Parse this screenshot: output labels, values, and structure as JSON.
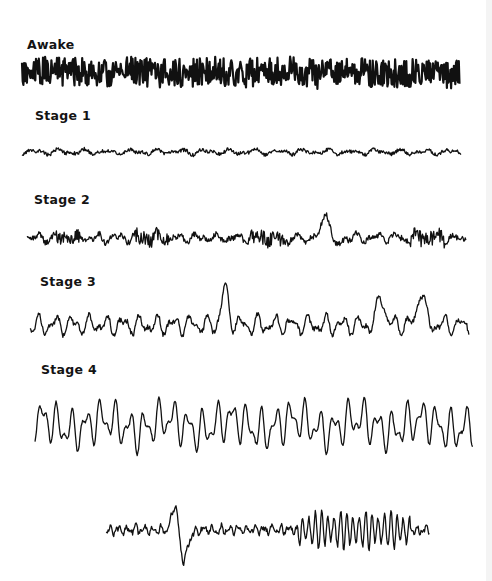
{
  "figure": {
    "ink_color": "#111111",
    "background": "#ffffff",
    "panels": [
      {
        "id": "awake",
        "label": "Awake",
        "label_pos": [
          27,
          37
        ],
        "trace": {
          "x0": 22,
          "x1": 460,
          "y": 72,
          "amp_slow": 3,
          "amp_fast": 9,
          "slow_cycles": 6,
          "fast_density": 1.0,
          "spikes": [],
          "stroke": 2.2,
          "seed": 11
        }
      },
      {
        "id": "stage-1",
        "label": "Stage 1",
        "label_pos": [
          35,
          108
        ],
        "trace": {
          "x0": 22,
          "x1": 461,
          "y": 152,
          "amp_slow": 3,
          "amp_fast": 2,
          "slow_cycles": 18,
          "fast_density": 0.55,
          "spikes": [],
          "stroke": 1.3,
          "seed": 23
        }
      },
      {
        "id": "stage-2",
        "label": "Stage 2",
        "label_pos": [
          34,
          192
        ],
        "trace": {
          "x0": 27,
          "x1": 466,
          "y": 238,
          "amp_slow": 5,
          "amp_fast": 3,
          "slow_cycles": 22,
          "fast_density": 0.6,
          "spindles": [
            [
              55,
              80
            ],
            [
              135,
              170
            ],
            [
              250,
              290
            ],
            [
              410,
              445
            ]
          ],
          "spikes": [
            {
              "x": 327,
              "h": -30,
              "w": 6
            },
            {
              "x": 334,
              "h": 14,
              "w": 6
            }
          ],
          "stroke": 1.3,
          "seed": 37
        }
      },
      {
        "id": "stage-3",
        "label": "Stage 3",
        "label_pos": [
          40,
          274
        ],
        "trace": {
          "x0": 30,
          "x1": 469,
          "y": 325,
          "amp_slow": 11,
          "amp_fast": 3,
          "slow_cycles": 26,
          "fast_density": 0.5,
          "spikes": [
            {
              "x": 225,
              "h": -35,
              "w": 5
            },
            {
              "x": 381,
              "h": -30,
              "w": 5
            },
            {
              "x": 421,
              "h": -35,
              "w": 5
            }
          ],
          "stroke": 1.3,
          "seed": 51
        }
      },
      {
        "id": "stage-4",
        "label": "Stage 4",
        "label_pos": [
          41,
          362
        ],
        "trace": {
          "x0": 35,
          "x1": 473,
          "y": 425,
          "amp_slow": 24,
          "amp_fast": 2,
          "slow_cycles": 30,
          "fast_density": 0.35,
          "spikes": [],
          "stroke": 1.3,
          "seed": 67
        }
      },
      {
        "id": "transition",
        "label": "",
        "label_pos": [
          0,
          0
        ],
        "trace": {
          "x0": 106,
          "x1": 430,
          "y": 530,
          "amp_slow": 5,
          "amp_fast": 3,
          "slow_cycles": 38,
          "fast_density": 0.5,
          "spikes": [
            {
              "x": 176,
              "h": -40,
              "w": 5
            },
            {
              "x": 182,
              "h": 36,
              "w": 7
            }
          ],
          "burst": [
            298,
            410,
            15
          ],
          "stroke": 1.3,
          "seed": 83
        }
      }
    ]
  }
}
